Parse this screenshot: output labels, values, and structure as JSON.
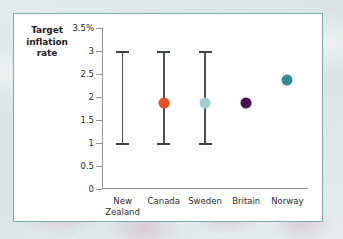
{
  "figure": {
    "frame_border_color": "#7fa8a8",
    "plot_background": "#ffffff",
    "axis_color": "#8d9496",
    "errorbar_color": "#4a4f52"
  },
  "chart_data": {
    "type": "scatter",
    "title": "",
    "ylabel": "Target inflation rate",
    "xlabel": "",
    "ylim": [
      0,
      3.5
    ],
    "grid": false,
    "legend": false,
    "y_ticks": [
      0,
      0.5,
      1,
      1.5,
      2,
      2.5,
      3,
      3.5
    ],
    "y_tick_labels": [
      "0",
      "0.5",
      "1",
      "1.5",
      "2",
      "2.5",
      "3",
      "3.5%"
    ],
    "categories": [
      "New\nZealand",
      "Canada",
      "Sweden",
      "Britain",
      "Norway"
    ],
    "points": [
      {
        "category": "New\nZealand",
        "low": 1,
        "high": 3,
        "target": null,
        "has_range": true,
        "marker_color": null,
        "marker_size": 0
      },
      {
        "category": "Canada",
        "low": 1,
        "high": 3,
        "target": 2,
        "has_range": true,
        "marker_color": "#e8501e",
        "marker_size": 11
      },
      {
        "category": "Sweden",
        "low": 1,
        "high": 3,
        "target": 2,
        "has_range": true,
        "marker_color": "#9ecfcd",
        "marker_size": 11
      },
      {
        "category": "Britain",
        "low": null,
        "high": null,
        "target": 2,
        "has_range": false,
        "marker_color": "#4b0c54",
        "marker_size": 11
      },
      {
        "category": "Norway",
        "low": null,
        "high": null,
        "target": 2.5,
        "has_range": false,
        "marker_color": "#2d8c94",
        "marker_size": 11
      }
    ]
  }
}
